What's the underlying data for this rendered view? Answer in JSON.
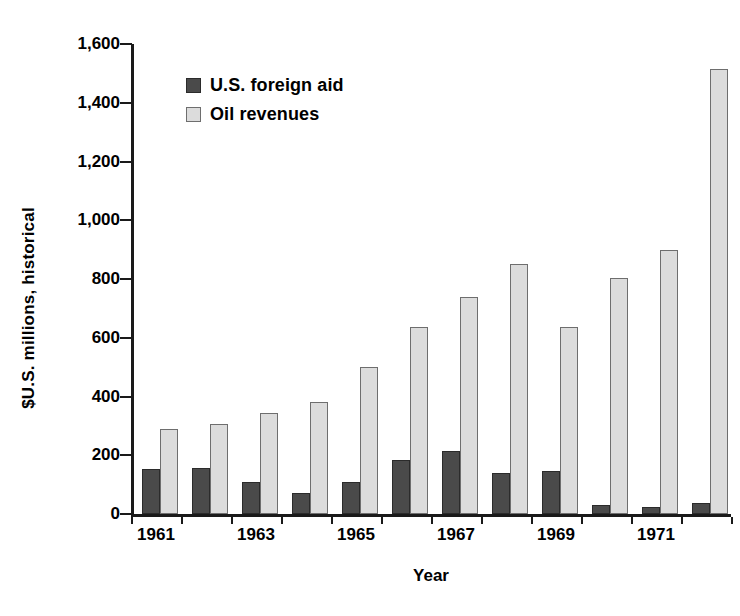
{
  "chart_data": {
    "type": "bar",
    "title": "",
    "xlabel": "Year",
    "ylabel": "$U.S. millions, historical",
    "ylim": [
      0,
      1600
    ],
    "ytick_step": 200,
    "grid": false,
    "legend_position": "top-left",
    "categories": [
      "1961",
      "1962",
      "1963",
      "1964",
      "1965",
      "1966",
      "1967",
      "1968",
      "1969",
      "1970",
      "1971",
      "1972"
    ],
    "xtick_labels": [
      "1961",
      "1963",
      "1965",
      "1967",
      "1969",
      "1971"
    ],
    "ytick_labels": [
      "0",
      "200",
      "400",
      "600",
      "800",
      "1,000",
      "1,200",
      "1,400",
      "1,600"
    ],
    "series": [
      {
        "name": "U.S. foreign aid",
        "color": "#4a4a4a",
        "values": [
          152,
          155,
          110,
          70,
          110,
          185,
          215,
          140,
          145,
          30,
          25,
          38
        ]
      },
      {
        "name": "Oil revenues",
        "color": "#dcdcdc",
        "values": [
          288,
          305,
          345,
          380,
          500,
          635,
          740,
          850,
          635,
          805,
          900,
          1515
        ]
      }
    ]
  },
  "legend": {
    "items": [
      {
        "label": "U.S. foreign aid",
        "swatch": "aid"
      },
      {
        "label": "Oil revenues",
        "swatch": "oil"
      }
    ]
  },
  "axes": {
    "x_title": "Year",
    "y_title": "$U.S. millions, historical"
  }
}
